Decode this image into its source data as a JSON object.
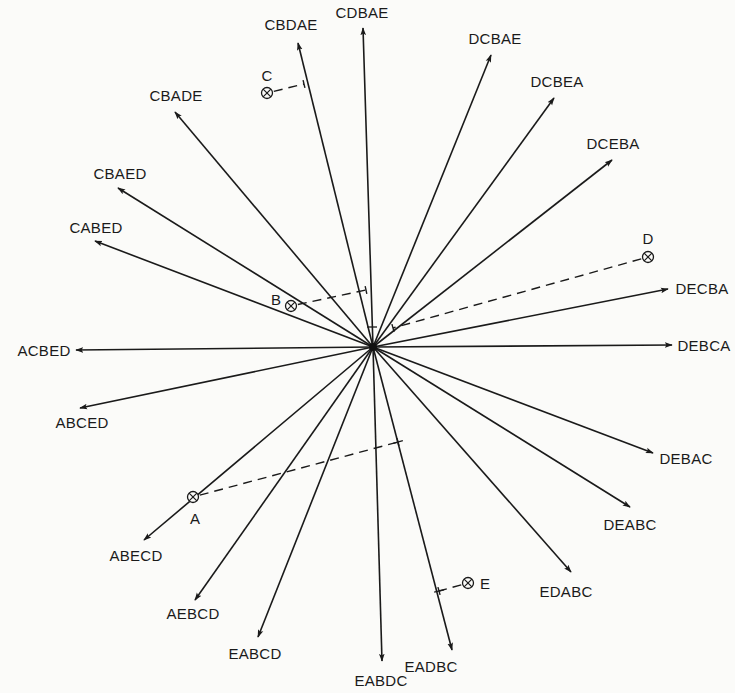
{
  "diagram": {
    "title": "",
    "center": {
      "x": 373,
      "y": 347
    },
    "ray_color": "#1a1a1a",
    "rays": [
      {
        "label": "CDBAE",
        "tip": [
          363,
          28
        ],
        "label_pos": [
          362,
          18
        ],
        "anchor": "middle"
      },
      {
        "label": "CBDAE",
        "tip": [
          298,
          43
        ],
        "label_pos": [
          291,
          30
        ],
        "anchor": "middle"
      },
      {
        "label": "DCBAE",
        "tip": [
          491,
          55
        ],
        "label_pos": [
          495,
          44
        ],
        "anchor": "middle"
      },
      {
        "label": "DCBEA",
        "tip": [
          554,
          98
        ],
        "label_pos": [
          557,
          87
        ],
        "anchor": "middle"
      },
      {
        "label": "DCEBA",
        "tip": [
          612,
          160
        ],
        "label_pos": [
          613,
          149
        ],
        "anchor": "middle"
      },
      {
        "label": "CBADE",
        "tip": [
          175,
          112
        ],
        "label_pos": [
          176,
          101
        ],
        "anchor": "middle"
      },
      {
        "label": "CBAED",
        "tip": [
          118,
          188
        ],
        "label_pos": [
          120,
          179
        ],
        "anchor": "middle"
      },
      {
        "label": "CABED",
        "tip": [
          95,
          241
        ],
        "label_pos": [
          96,
          233
        ],
        "anchor": "middle"
      },
      {
        "label": "ACBED",
        "tip": [
          76,
          350
        ],
        "label_pos": [
          44,
          356
        ],
        "anchor": "middle"
      },
      {
        "label": "ABCED",
        "tip": [
          80,
          408
        ],
        "label_pos": [
          82,
          428
        ],
        "anchor": "middle"
      },
      {
        "label": "DECBA",
        "tip": [
          668,
          289
        ],
        "label_pos": [
          702,
          294
        ],
        "anchor": "middle"
      },
      {
        "label": "DEBCA",
        "tip": [
          672,
          345
        ],
        "label_pos": [
          704,
          351
        ],
        "anchor": "middle"
      },
      {
        "label": "DEBAC",
        "tip": [
          653,
          453
        ],
        "label_pos": [
          686,
          464
        ],
        "anchor": "middle"
      },
      {
        "label": "DEABC",
        "tip": [
          630,
          507
        ],
        "label_pos": [
          630,
          530
        ],
        "anchor": "middle"
      },
      {
        "label": "EDABC",
        "tip": [
          571,
          572
        ],
        "label_pos": [
          566,
          597
        ],
        "anchor": "middle"
      },
      {
        "label": "EADBC",
        "tip": [
          452,
          650
        ],
        "label_pos": [
          431,
          672
        ],
        "anchor": "middle"
      },
      {
        "label": "EABDC",
        "tip": [
          382,
          661
        ],
        "label_pos": [
          381,
          686
        ],
        "anchor": "middle"
      },
      {
        "label": "EABCD",
        "tip": [
          258,
          637
        ],
        "label_pos": [
          255,
          659
        ],
        "anchor": "middle"
      },
      {
        "label": "AEBCD",
        "tip": [
          195,
          600
        ],
        "label_pos": [
          193,
          619
        ],
        "anchor": "middle"
      },
      {
        "label": "ABECD",
        "tip": [
          144,
          540
        ],
        "label_pos": [
          136,
          561
        ],
        "anchor": "middle"
      }
    ],
    "points": [
      {
        "label": "A",
        "pos": [
          193,
          497
        ],
        "label_pos": [
          195,
          524
        ],
        "foot": [
          398,
          442
        ]
      },
      {
        "label": "B",
        "pos": [
          291,
          306
        ],
        "label_pos": [
          276,
          305
        ],
        "foot": [
          366,
          290
        ]
      },
      {
        "label": "C",
        "pos": [
          267,
          93
        ],
        "label_pos": [
          267,
          81
        ],
        "foot": [
          304,
          84
        ]
      },
      {
        "label": "D",
        "pos": [
          648,
          257
        ],
        "label_pos": [
          648,
          244
        ],
        "foot": [
          393,
          328
        ]
      },
      {
        "label": "E",
        "pos": [
          468,
          583
        ],
        "label_pos": [
          485,
          589
        ],
        "foot": [
          439,
          591
        ]
      }
    ],
    "perpendicular_ticks": [
      {
        "at": [
          372,
          327
        ],
        "dir": [
          1,
          0
        ]
      },
      {
        "at": [
          398,
          442
        ],
        "dir": [
          0.97,
          -0.26
        ]
      },
      {
        "at": [
          439,
          591
        ],
        "dir": [
          0.97,
          -0.24
        ]
      }
    ]
  }
}
